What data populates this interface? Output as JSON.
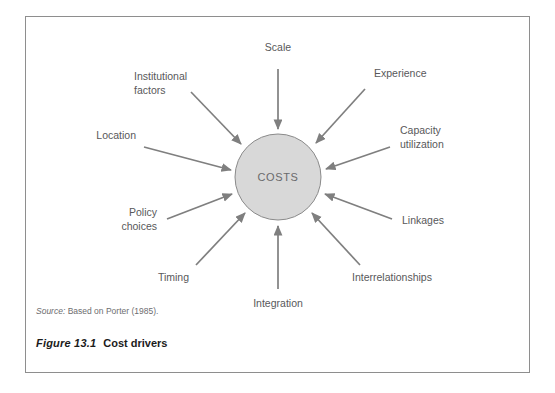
{
  "figure": {
    "center_node": "COSTS",
    "source_label": "Source:",
    "source_text": " Based on Porter (1985).",
    "caption_number": "Figure 13.1",
    "caption_title": "Cost drivers",
    "colors": {
      "frame_border": "#8e8e8e",
      "circle_fill": "#d8d8d8",
      "circle_stroke": "#8a8a8a",
      "arrow": "#7f7f7f",
      "label_text": "#58585a",
      "caption_text": "#1b1b1b",
      "page_background": "#ffffff"
    }
  },
  "drivers": [
    {
      "id": "scale",
      "label": "Scale",
      "lines": [
        "Scale"
      ]
    },
    {
      "id": "experience",
      "label": "Experience",
      "lines": [
        "Experience"
      ]
    },
    {
      "id": "capacity-utilization",
      "label": "Capacity utilization",
      "lines": [
        "Capacity",
        "utilization"
      ]
    },
    {
      "id": "linkages",
      "label": "Linkages",
      "lines": [
        "Linkages"
      ]
    },
    {
      "id": "interrelationships",
      "label": "Interrelationships",
      "lines": [
        "Interrelationships"
      ]
    },
    {
      "id": "integration",
      "label": "Integration",
      "lines": [
        "Integration"
      ]
    },
    {
      "id": "timing",
      "label": "Timing",
      "lines": [
        "Timing"
      ]
    },
    {
      "id": "policy-choices",
      "label": "Policy choices",
      "lines": [
        "Policy",
        "choices"
      ]
    },
    {
      "id": "location",
      "label": "Location",
      "lines": [
        "Location"
      ]
    },
    {
      "id": "institutional-factors",
      "label": "Institutional factors",
      "lines": [
        "Institutional",
        "factors"
      ]
    }
  ]
}
